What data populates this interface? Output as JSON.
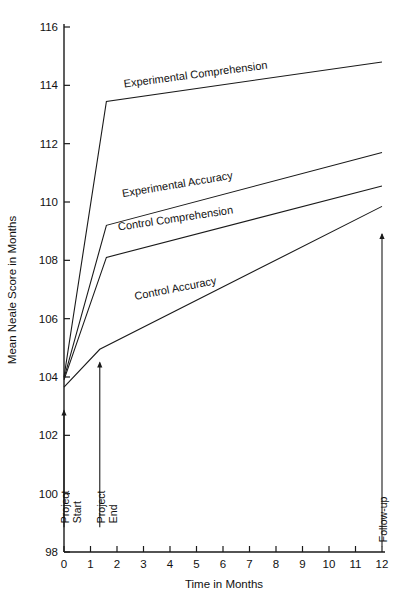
{
  "chart_data": {
    "type": "line",
    "title": "",
    "xlabel": "Time in Months",
    "ylabel": "Mean Neale Score in Months",
    "xlim": [
      0,
      12
    ],
    "ylim": [
      98,
      116
    ],
    "grid": false,
    "legend_position": "inline-labels",
    "xticks": [
      "0",
      "1",
      "2",
      "3",
      "4",
      "5",
      "6",
      "7",
      "8",
      "9",
      "10",
      "11",
      "12"
    ],
    "yticks": [
      "98",
      "100",
      "102",
      "104",
      "106",
      "108",
      "110",
      "112",
      "114",
      "116"
    ],
    "series": [
      {
        "name": "Experimental Comprehension",
        "x": [
          0,
          1.6,
          12
        ],
        "values": [
          104.0,
          113.45,
          114.8
        ]
      },
      {
        "name": "Experimental Accuracy",
        "x": [
          0,
          1.6,
          12
        ],
        "values": [
          103.95,
          109.2,
          111.7
        ]
      },
      {
        "name": "Control Comprehension",
        "x": [
          0,
          1.6,
          12
        ],
        "values": [
          103.9,
          108.1,
          110.55
        ]
      },
      {
        "name": "Control Accuracy",
        "x": [
          0,
          1.35,
          12
        ],
        "values": [
          103.65,
          104.95,
          109.85
        ]
      }
    ],
    "annotations": [
      {
        "label_line1": "Project",
        "label_line2": "Start",
        "x": 0,
        "y_from": 98.85,
        "y_to": 102.85
      },
      {
        "label_line1": "Project",
        "label_line2": "End",
        "x": 1.35,
        "y_from": 98.85,
        "y_to": 104.5
      },
      {
        "label_line1": "Follow-up",
        "label_line2": "",
        "x": 12,
        "y_from": 98.2,
        "y_to": 108.9
      }
    ]
  }
}
